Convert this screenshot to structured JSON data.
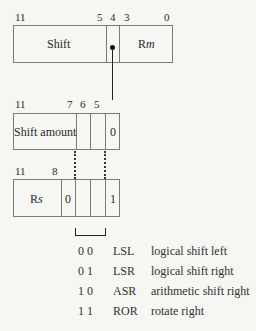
{
  "box1": {
    "bit_labels": [
      "11",
      "5",
      "4",
      "3",
      "0"
    ],
    "fields": {
      "shift": "Shift",
      "rm_prefix": "R",
      "rm_italic": "m"
    }
  },
  "box2": {
    "bit_labels": [
      "11",
      "7",
      "6",
      "5"
    ],
    "fields": {
      "shift_amount": "Shift amount",
      "bit4": "0"
    }
  },
  "box3": {
    "bit_labels": [
      "11",
      "8"
    ],
    "fields": {
      "rs_prefix": "R",
      "rs_italic": "s",
      "bit7": "0",
      "bit4": "1"
    }
  },
  "legend": [
    {
      "code": "0 0",
      "mnemonic": "LSL",
      "description": "logical shift left"
    },
    {
      "code": "0 1",
      "mnemonic": "LSR",
      "description": "logical shift right"
    },
    {
      "code": "1 0",
      "mnemonic": "ASR",
      "description": "arithmetic shift right"
    },
    {
      "code": "1 1",
      "mnemonic": "ROR",
      "description": "rotate right"
    }
  ],
  "colors": {
    "background": "#f6f6f3",
    "line": "#7a7a7a",
    "text": "#2a2a2a"
  }
}
